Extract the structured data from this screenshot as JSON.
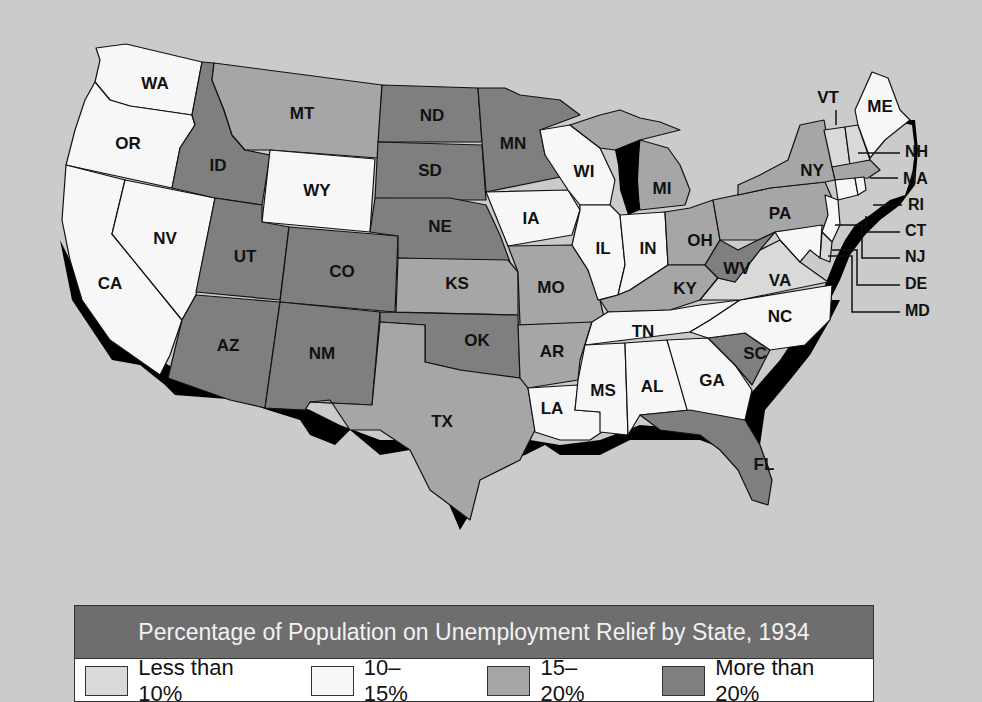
{
  "colors": {
    "background": "#cbcbcb",
    "lt10": "#d9d9d9",
    "b10_15": "#f7f7f7",
    "b15_20": "#a6a6a6",
    "gt20": "#7f7f7f",
    "title_bar": "#6e6e6e"
  },
  "legend": {
    "title": "Percentage of Population on Unemployment Relief by State, 1934",
    "items": [
      {
        "label": "Less than 10%",
        "swatch": "#d9d9d9"
      },
      {
        "label": "10–15%",
        "swatch": "#f7f7f7"
      },
      {
        "label": "15–20%",
        "swatch": "#a6a6a6"
      },
      {
        "label": "More than 20%",
        "swatch": "#7f7f7f"
      }
    ]
  },
  "states": {
    "WA": {
      "label": "WA",
      "category": "10–15%"
    },
    "OR": {
      "label": "OR",
      "category": "10–15%"
    },
    "CA": {
      "label": "CA",
      "category": "10–15%"
    },
    "NV": {
      "label": "NV",
      "category": "10–15%"
    },
    "ID": {
      "label": "ID",
      "category": "More than 20%"
    },
    "MT": {
      "label": "MT",
      "category": "15–20%"
    },
    "WY": {
      "label": "WY",
      "category": "10–15%"
    },
    "UT": {
      "label": "UT",
      "category": "More than 20%"
    },
    "CO": {
      "label": "CO",
      "category": "More than 20%"
    },
    "AZ": {
      "label": "AZ",
      "category": "More than 20%"
    },
    "NM": {
      "label": "NM",
      "category": "More than 20%"
    },
    "ND": {
      "label": "ND",
      "category": "More than 20%"
    },
    "SD": {
      "label": "SD",
      "category": "More than 20%"
    },
    "NE": {
      "label": "NE",
      "category": "More than 20%"
    },
    "KS": {
      "label": "KS",
      "category": "15–20%"
    },
    "OK": {
      "label": "OK",
      "category": "More than 20%"
    },
    "TX": {
      "label": "TX",
      "category": "15–20%"
    },
    "MN": {
      "label": "MN",
      "category": "More than 20%"
    },
    "IA": {
      "label": "IA",
      "category": "10–15%"
    },
    "MO": {
      "label": "MO",
      "category": "15–20%"
    },
    "AR": {
      "label": "AR",
      "category": "15–20%"
    },
    "LA": {
      "label": "LA",
      "category": "10–15%"
    },
    "WI": {
      "label": "WI",
      "category": "10–15%"
    },
    "IL": {
      "label": "IL",
      "category": "10–15%"
    },
    "MI": {
      "label": "MI",
      "category": "15–20%"
    },
    "IN": {
      "label": "IN",
      "category": "10–15%"
    },
    "OH": {
      "label": "OH",
      "category": "15–20%"
    },
    "KY": {
      "label": "KY",
      "category": "15–20%"
    },
    "TN": {
      "label": "TN",
      "category": "10–15%"
    },
    "MS": {
      "label": "MS",
      "category": "10–15%"
    },
    "AL": {
      "label": "AL",
      "category": "10–15%"
    },
    "GA": {
      "label": "GA",
      "category": "10–15%"
    },
    "FL": {
      "label": "FL",
      "category": "More than 20%"
    },
    "SC": {
      "label": "SC",
      "category": "More than 20%"
    },
    "NC": {
      "label": "NC",
      "category": "10–15%"
    },
    "VA": {
      "label": "VA",
      "category": "Less than 10%"
    },
    "WV": {
      "label": "WV",
      "category": "More than 20%"
    },
    "PA": {
      "label": "PA",
      "category": "15–20%"
    },
    "NY": {
      "label": "NY",
      "category": "15–20%"
    },
    "VT": {
      "label": "VT",
      "category": "Less than 10%"
    },
    "NH": {
      "label": "NH",
      "category": "Less than 10%"
    },
    "ME": {
      "label": "ME",
      "category": "10–15%"
    },
    "MA": {
      "label": "MA",
      "category": "15–20%"
    },
    "RI": {
      "label": "RI",
      "category": "10–15%"
    },
    "CT": {
      "label": "CT",
      "category": "10–15%"
    },
    "NJ": {
      "label": "NJ",
      "category": "10–15%"
    },
    "DE": {
      "label": "DE",
      "category": "Less than 10%"
    },
    "MD": {
      "label": "MD",
      "category": "10–15%"
    }
  }
}
